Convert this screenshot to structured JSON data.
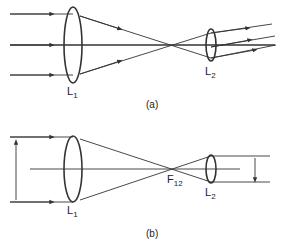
{
  "figure_a": {
    "caption": "(a)",
    "lens1": {
      "label": "L",
      "sub": "1"
    },
    "lens2": {
      "label": "L",
      "sub": "2"
    }
  },
  "figure_b": {
    "caption": "(b)",
    "lens1": {
      "label": "L",
      "sub": "1"
    },
    "lens2": {
      "label": "L",
      "sub": "2"
    },
    "focal_point": {
      "label": "F",
      "sub": "12"
    }
  },
  "colors": {
    "stroke": "#333333",
    "background": "#ffffff"
  }
}
